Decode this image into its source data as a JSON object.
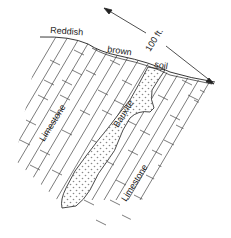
{
  "diagram": {
    "type": "geologic-cross-section",
    "colors": {
      "ink": "#333333",
      "background": "#ffffff",
      "stipple": "#888888"
    },
    "labels": {
      "soil_word1": "Reddish",
      "soil_word2": "brown",
      "soil_word3": "soil",
      "scale": "100 ft.",
      "rock_left": "Limestone",
      "rock_right": "Limestone",
      "deposit": "Bauxite"
    },
    "units": [
      {
        "name": "Reddish brown soil",
        "pattern": "thin band along surface"
      },
      {
        "name": "Limestone",
        "pattern": "brick (bedded)"
      },
      {
        "name": "Bauxite",
        "pattern": "stippled dots"
      }
    ],
    "scale_bar": {
      "length_label": "100 ft.",
      "direction": "diagonal, arrows at both ends"
    }
  }
}
